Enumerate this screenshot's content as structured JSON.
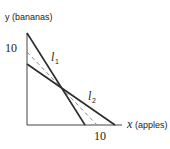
{
  "diagram": {
    "y_axis_label": "y (bananas)",
    "x_axis_var": "x",
    "x_axis_unit": "(apples)",
    "y_tick_label": "10",
    "x_tick_label": "10",
    "line1_label": "l",
    "line1_sub": "1",
    "line2_label": "l",
    "line2_sub": "2"
  },
  "colors": {
    "solid_line": "#2b2b2b",
    "dashed_line": "#8a8a8a",
    "axis": "#444444",
    "text": "#222222"
  }
}
